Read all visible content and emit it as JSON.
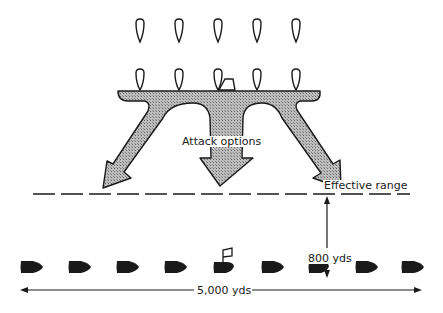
{
  "diagram": {
    "labels": {
      "attack_options": "Attack options",
      "effective_range": "Effective range",
      "distance_vertical": "800 yds",
      "distance_horizontal": "5,000 yds"
    },
    "attackers": {
      "rows": 2,
      "per_row": 5,
      "style": "outline",
      "flagship_marker": "front row, center"
    },
    "defenders": {
      "count": 9,
      "style": "filled",
      "flagship_marker": "5th ship"
    },
    "colors": {
      "ink": "#1a1a1a",
      "arrow_fill": "#a8a8a8"
    }
  }
}
